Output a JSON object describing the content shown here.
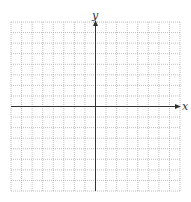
{
  "diagram": {
    "type": "coordinate-grid",
    "x_axis_label": "x",
    "y_axis_label": "y",
    "grid": {
      "columns": 16,
      "rows": 16,
      "line_style": "dotted",
      "line_color": "#b0b0b0",
      "left": 11,
      "top": 22,
      "right": 180,
      "bottom": 191
    },
    "axes": {
      "color": "#333333",
      "origin_px": [
        95.5,
        106.5
      ],
      "x_arrow": "right",
      "y_arrow": "up"
    }
  }
}
